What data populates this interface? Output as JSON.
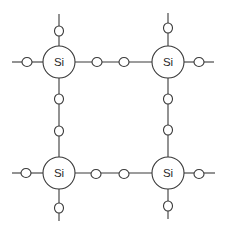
{
  "diagram": {
    "type": "silicon-crystal-lattice-2d",
    "colors": {
      "line": "#3a3a3a",
      "label": "#2a2a2a",
      "background": "#ffffff"
    },
    "atoms": [
      {
        "id": "si-top-left",
        "label": "Si",
        "cx": 59,
        "cy": 62,
        "r": 16
      },
      {
        "id": "si-top-right",
        "label": "Si",
        "cx": 168,
        "cy": 62,
        "r": 16
      },
      {
        "id": "si-bottom-left",
        "label": "Si",
        "cx": 59,
        "cy": 173,
        "r": 16
      },
      {
        "id": "si-bottom-right",
        "label": "Si",
        "cx": 168,
        "cy": 173,
        "r": 16
      }
    ],
    "bonds": [
      {
        "from": "si-top-left",
        "to": "si-top-right",
        "electrons": 2
      },
      {
        "from": "si-bottom-left",
        "to": "si-bottom-right",
        "electrons": 2
      },
      {
        "from": "si-top-left",
        "to": "si-bottom-left",
        "electrons": 2
      },
      {
        "from": "si-top-right",
        "to": "si-bottom-right",
        "electrons": 2
      }
    ],
    "dangling_bonds": [
      {
        "atom": "si-top-left",
        "direction": "up",
        "electrons": 1
      },
      {
        "atom": "si-top-left",
        "direction": "left",
        "electrons": 1
      },
      {
        "atom": "si-top-right",
        "direction": "up",
        "electrons": 1
      },
      {
        "atom": "si-top-right",
        "direction": "right",
        "electrons": 1
      },
      {
        "atom": "si-bottom-left",
        "direction": "left",
        "electrons": 1
      },
      {
        "atom": "si-bottom-left",
        "direction": "down",
        "electrons": 1
      },
      {
        "atom": "si-bottom-right",
        "direction": "right",
        "electrons": 1
      },
      {
        "atom": "si-bottom-right",
        "direction": "down",
        "electrons": 1
      }
    ],
    "electron_count": 16,
    "electron_radius": 4.5
  }
}
